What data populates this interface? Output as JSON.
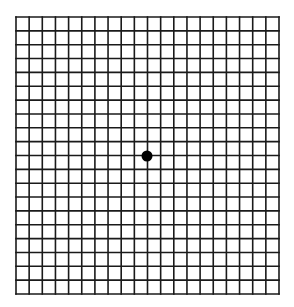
{
  "diagram": {
    "type": "amsler-grid",
    "columns": 20,
    "rows": 20,
    "grid_bounds": {
      "left": 16,
      "top": 17,
      "right": 279,
      "bottom": 294
    },
    "line_color": "#1a1a1a",
    "line_width": 1.6,
    "background_color": "#ffffff",
    "fixation_dot": {
      "cx": 147,
      "cy": 156,
      "r": 5.5,
      "color": "#000000"
    }
  }
}
